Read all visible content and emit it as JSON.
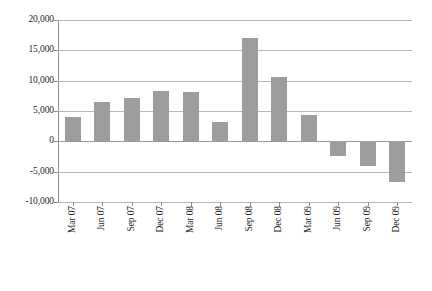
{
  "chart_data": {
    "type": "bar",
    "title": "",
    "subtitle": "",
    "xlabel": "",
    "ylabel": "",
    "categories": [
      "Mar 07",
      "Jun 07",
      "Sep 07",
      "Dec 07",
      "Mar 08",
      "Jun 08",
      "Sep 08",
      "Dec 08",
      "Mar 09",
      "Jun 09",
      "Sep 09",
      "Dec 09"
    ],
    "values": [
      4000,
      6500,
      7200,
      8300,
      8100,
      3200,
      17100,
      10600,
      4400,
      -2500,
      -4000,
      -6700
    ],
    "series": [
      {
        "name": "",
        "values": [
          4000,
          6500,
          7200,
          8300,
          8100,
          3200,
          17100,
          10600,
          4400,
          -2500,
          -4000,
          -6700
        ]
      }
    ],
    "ylim": [
      -10000,
      20000
    ],
    "y_ticks": [
      20000,
      15000,
      10000,
      5000,
      0,
      -5000,
      -10000
    ],
    "y_tick_labels": [
      "20,000",
      "15,000",
      "10,000",
      "5,000",
      "0",
      "-5,000",
      "-10,000"
    ],
    "grid": true,
    "grid_axis": "y",
    "legend": false,
    "legend_position": "none",
    "bar_color": "#9d9d9d",
    "gridline_color": "#b6b6b6",
    "axis_color": "#8c8c8c",
    "background_color": "#ffffff"
  }
}
